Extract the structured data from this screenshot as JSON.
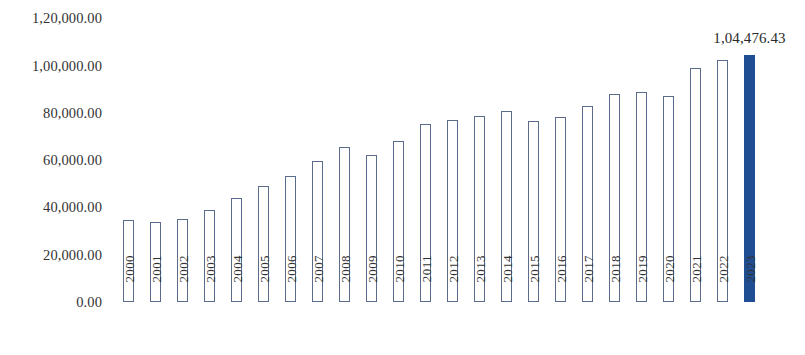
{
  "chart_data": {
    "type": "bar",
    "title": "",
    "subtitle": "",
    "xlabel": "",
    "ylabel": "",
    "grid": false,
    "legend": "none",
    "ylim": [
      0,
      120000
    ],
    "y_tick_labels": [
      "1,20,000.00",
      "1,00,000.00",
      "80,000.00",
      "60,000.00",
      "40,000.00",
      "20,000.00",
      "0.00"
    ],
    "y_tick_values": [
      120000,
      100000,
      80000,
      60000,
      40000,
      20000,
      0
    ],
    "categories": [
      "2000",
      "2001",
      "2002",
      "2003",
      "2004",
      "2005",
      "2006",
      "2007",
      "2008",
      "2009",
      "2010",
      "2011",
      "2012",
      "2013",
      "2014",
      "2015",
      "2016",
      "2017",
      "2018",
      "2019",
      "2020",
      "2021",
      "2022",
      "2023"
    ],
    "values": [
      34700,
      33900,
      35100,
      39000,
      44000,
      49100,
      53400,
      59700,
      65600,
      62200,
      68200,
      75400,
      77100,
      78700,
      80900,
      76600,
      78300,
      83000,
      88100,
      88900,
      87200,
      99100,
      102500,
      104476.43
    ],
    "data_labels": [
      "",
      "",
      "",
      "",
      "",
      "",
      "",
      "",
      "",
      "",
      "",
      "",
      "",
      "",
      "",
      "",
      "",
      "",
      "",
      "",
      "",
      "",
      "",
      "1,04,476.43"
    ],
    "highlight_index": 23,
    "colors": {
      "bar_outline": "#5b6b8c",
      "bar_fill": "#ffffff",
      "highlight_fill": "#1f4e93",
      "text": "#333333",
      "background": "#ffffff"
    }
  }
}
